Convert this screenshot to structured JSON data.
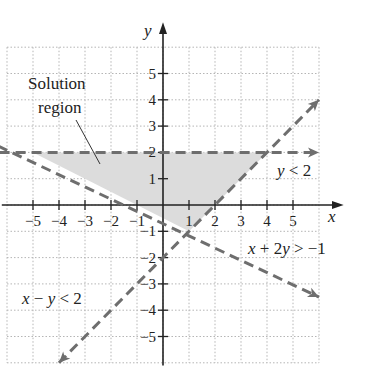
{
  "chart_data": {
    "type": "line",
    "title": "",
    "xlabel": "x",
    "ylabel": "y",
    "xlim": [
      -6,
      6
    ],
    "ylim": [
      -6,
      6
    ],
    "grid": true,
    "x_ticks": [
      -5,
      -4,
      -3,
      -2,
      -1,
      1,
      2,
      3,
      4,
      5
    ],
    "y_ticks": [
      5,
      4,
      3,
      2,
      1,
      -1,
      -2,
      -3,
      -4,
      -5
    ],
    "x_tick_labels": [
      "−5",
      "−4",
      "−3",
      "−2",
      "−1",
      "1",
      "2",
      "3",
      "4",
      "5"
    ],
    "y_tick_labels": [
      "5",
      "4",
      "3",
      "2",
      "1",
      "−1",
      "−2",
      "−3",
      "−4",
      "−5"
    ],
    "series": [
      {
        "name": "y < 2",
        "boundary": "y = 2",
        "style": "dashed",
        "points": [
          [
            -6.9,
            2
          ],
          [
            6,
            2
          ]
        ],
        "label_pos": [
          4.5,
          1.2
        ]
      },
      {
        "name": "x − y < 2",
        "boundary": "y = x − 2",
        "style": "dashed",
        "points": [
          [
            -4,
            -6
          ],
          [
            6,
            4
          ]
        ],
        "label_pos": [
          -5.4,
          -2.5
        ]
      },
      {
        "name": "x + 2y > −1",
        "boundary": "y = (−1 − x) / 2",
        "style": "dashed",
        "points": [
          [
            -6.9,
            2.5
          ],
          [
            6,
            -3.5
          ]
        ],
        "label_pos": [
          2.2,
          -1.7
        ]
      }
    ],
    "shaded_region": {
      "label": "Solution region",
      "vertices": [
        [
          -5,
          2
        ],
        [
          4,
          2
        ],
        [
          1,
          -1
        ]
      ],
      "color": "#dcdcdc"
    },
    "annotations": [
      {
        "text": "Solution",
        "pos": [
          -3.9,
          4.6
        ]
      },
      {
        "text": "region",
        "pos": [
          -3.9,
          3.6
        ]
      }
    ]
  },
  "labels": {
    "x_axis": "x",
    "y_axis": "y",
    "ineq_y": [
      "y",
      " < 2"
    ],
    "ineq_xy": [
      "x",
      " − ",
      "y",
      " < 2"
    ],
    "ineq_x2y": [
      "x",
      " + 2",
      "y",
      " > −1"
    ],
    "solution_line1": "Solution",
    "solution_line2": "region"
  },
  "colors": {
    "boundary": "#6e6e6e",
    "axis": "#222222",
    "grid": "#b5b5b5",
    "shade": "#dcdcdc"
  }
}
